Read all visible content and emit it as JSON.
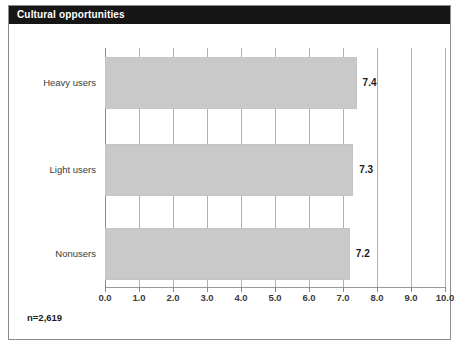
{
  "panel": {
    "title": "Cultural opportunities",
    "title_bar_color": "#161616",
    "title_text_color": "#ffffff",
    "background_color": "#ffffff",
    "border_color": "#8c8c8c"
  },
  "note": "n=2,619",
  "chart_data": {
    "type": "bar",
    "orientation": "horizontal",
    "title": "Cultural opportunities",
    "categories": [
      "Heavy users",
      "Light users",
      "Nonusers"
    ],
    "values": [
      7.4,
      7.3,
      7.2
    ],
    "value_labels": [
      "7.4",
      "7.3",
      "7.2"
    ],
    "xlabel": "",
    "ylabel": "",
    "xlim": [
      0.0,
      10.0
    ],
    "xticks": [
      0.0,
      1.0,
      2.0,
      3.0,
      4.0,
      5.0,
      6.0,
      7.0,
      8.0,
      9.0,
      10.0
    ],
    "xtick_labels": [
      "0.0",
      "1.0",
      "2.0",
      "3.0",
      "4.0",
      "5.0",
      "6.0",
      "7.0",
      "8.0",
      "9.0",
      "10.0"
    ],
    "grid": true,
    "grid_axis": "x",
    "legend": null,
    "bar_color": "#c9c9c9",
    "grid_color": "#b0b0b0",
    "annotations": [
      "n=2,619"
    ]
  }
}
